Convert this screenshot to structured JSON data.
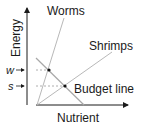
{
  "diagram": {
    "axes": {
      "y_label": "Energy",
      "x_label": "Nutrient"
    },
    "lines": {
      "worms": "Worms",
      "shrimps": "Shrimps",
      "budget": "Budget line"
    },
    "markers": {
      "w": "w",
      "s": "s"
    },
    "colors": {
      "axis": "#1a1a1a",
      "line": "#b8b8b8",
      "dashed": "#9a9a9a",
      "point": "#111111"
    }
  }
}
